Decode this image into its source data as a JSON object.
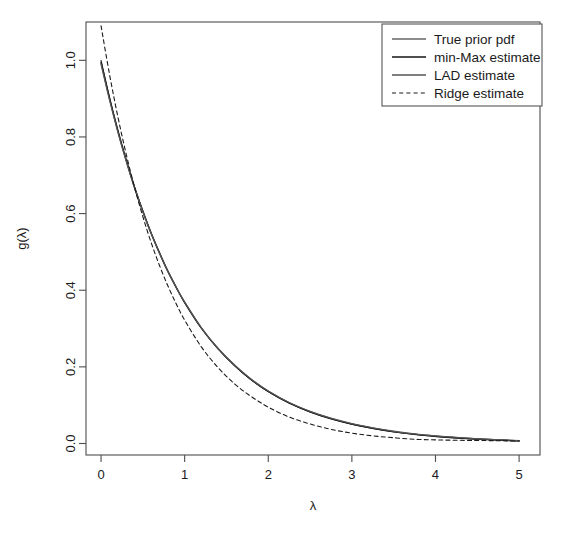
{
  "chart_data": {
    "type": "line",
    "title": "",
    "xlabel": "λ",
    "ylabel": "g(λ)",
    "xlim": [
      -0.18,
      5.25
    ],
    "ylim": [
      -0.03,
      1.1
    ],
    "grid": false,
    "legend_position": "top-right",
    "xticks": [
      "0",
      "1",
      "2",
      "3",
      "4",
      "5"
    ],
    "xtick_values": [
      0,
      1,
      2,
      3,
      4,
      5
    ],
    "yticks": [
      "0.0",
      "0.2",
      "0.4",
      "0.6",
      "0.8",
      "1.0"
    ],
    "ytick_values": [
      0.0,
      0.2,
      0.4,
      0.6,
      0.8,
      1.0
    ],
    "x": [
      0,
      0.1,
      0.2,
      0.3,
      0.4,
      0.5,
      0.6,
      0.7,
      0.8,
      0.9,
      1.0,
      1.2,
      1.4,
      1.6,
      1.8,
      2.0,
      2.25,
      2.5,
      2.75,
      3.0,
      3.25,
      3.5,
      3.75,
      4.0,
      4.25,
      4.5,
      4.75,
      5.0
    ],
    "series": [
      {
        "name": "True prior pdf",
        "style": "solid",
        "color": "#1a1a1a",
        "width": 1.0,
        "values": [
          1.0,
          0.905,
          0.819,
          0.741,
          0.67,
          0.607,
          0.549,
          0.497,
          0.449,
          0.407,
          0.368,
          0.301,
          0.247,
          0.202,
          0.165,
          0.135,
          0.105,
          0.082,
          0.064,
          0.05,
          0.039,
          0.03,
          0.024,
          0.018,
          0.014,
          0.011,
          0.009,
          0.0067
        ]
      },
      {
        "name": "min-Max estimate",
        "style": "solid",
        "color": "#141414",
        "width": 1.5,
        "values": [
          0.995,
          0.902,
          0.817,
          0.74,
          0.669,
          0.606,
          0.548,
          0.497,
          0.449,
          0.407,
          0.368,
          0.301,
          0.247,
          0.203,
          0.166,
          0.136,
          0.106,
          0.083,
          0.065,
          0.051,
          0.04,
          0.031,
          0.024,
          0.019,
          0.015,
          0.012,
          0.009,
          0.007
        ]
      },
      {
        "name": "LAD estimate",
        "style": "solid",
        "color": "#555555",
        "width": 1.3,
        "values": [
          0.99,
          0.898,
          0.814,
          0.738,
          0.668,
          0.605,
          0.548,
          0.496,
          0.449,
          0.407,
          0.369,
          0.302,
          0.248,
          0.204,
          0.167,
          0.137,
          0.107,
          0.084,
          0.066,
          0.052,
          0.041,
          0.032,
          0.025,
          0.02,
          0.016,
          0.012,
          0.01,
          0.0075
        ]
      },
      {
        "name": "Ridge estimate",
        "style": "dashed",
        "color": "#1a1a1a",
        "width": 1.1,
        "values": [
          1.09,
          0.965,
          0.854,
          0.756,
          0.669,
          0.592,
          0.524,
          0.464,
          0.411,
          0.364,
          0.322,
          0.252,
          0.198,
          0.155,
          0.122,
          0.095,
          0.069,
          0.051,
          0.037,
          0.027,
          0.02,
          0.015,
          0.011,
          0.0095,
          0.0085,
          0.008,
          0.0072,
          0.0065
        ]
      }
    ]
  },
  "plot_box": {
    "left": 86,
    "right": 540,
    "top": 22,
    "bottom": 455
  },
  "legend": {
    "entries": [
      {
        "label": "True prior pdf"
      },
      {
        "label": "min-Max estimate"
      },
      {
        "label": "LAD estimate"
      },
      {
        "label": "Ridge estimate"
      }
    ]
  }
}
